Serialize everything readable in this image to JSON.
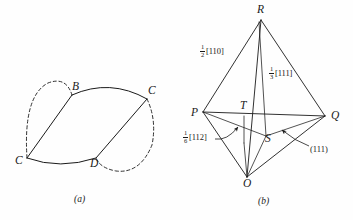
{
  "figure": {
    "background_color": "#fefefe",
    "line_color": "#1a1a1a",
    "panels": [
      {
        "id": "a",
        "caption": "(a)",
        "type": "dislocation-loop-diagram",
        "vertices": [
          {
            "name": "C",
            "label": "C",
            "x": 21,
            "y": 162,
            "role": "left-node"
          },
          {
            "name": "B",
            "label": "B",
            "x": 76,
            "y": 88,
            "role": "top-node"
          },
          {
            "name": "C2",
            "label": "C",
            "x": 150,
            "y": 93,
            "role": "right-node"
          },
          {
            "name": "D",
            "label": "D",
            "x": 93,
            "y": 164,
            "role": "bottom-node"
          }
        ],
        "solid_edges": [
          "C-B",
          "B-C2",
          "C2-D",
          "D-C",
          "C-C2"
        ],
        "dashed_arcs": [
          "C-B bulge left",
          "C2-D bulge right"
        ]
      },
      {
        "id": "b",
        "caption": "(b)",
        "type": "tetrahedron-burgers-vector-diagram",
        "vertices": [
          {
            "name": "R",
            "label": "R",
            "x": 261,
            "y": 12,
            "role": "apex"
          },
          {
            "name": "P",
            "label": "P",
            "x": 196,
            "y": 113,
            "role": "left"
          },
          {
            "name": "Q",
            "label": "Q",
            "x": 330,
            "y": 116,
            "role": "right"
          },
          {
            "name": "O",
            "label": "O",
            "x": 248,
            "y": 183,
            "role": "bottom"
          },
          {
            "name": "T",
            "label": "T",
            "x": 244,
            "y": 110,
            "role": "interior-on-PQ"
          },
          {
            "name": "S",
            "label": "S",
            "x": 268,
            "y": 140,
            "role": "interior-centroid"
          }
        ],
        "annotations": [
          {
            "name": "half-110",
            "numerator": "1",
            "denominator": "2",
            "bracket": "[110]",
            "x": 200,
            "y": 48
          },
          {
            "name": "third-111",
            "numerator": "1",
            "denominator": "3",
            "bracket": "[111]",
            "x": 269,
            "y": 70
          },
          {
            "name": "sixth-112",
            "numerator": "1",
            "denominator": "6",
            "bracket": "[112]",
            "x": 186,
            "y": 133
          },
          {
            "name": "plane-111",
            "text": "(111)",
            "x": 311,
            "y": 149
          }
        ]
      }
    ]
  }
}
